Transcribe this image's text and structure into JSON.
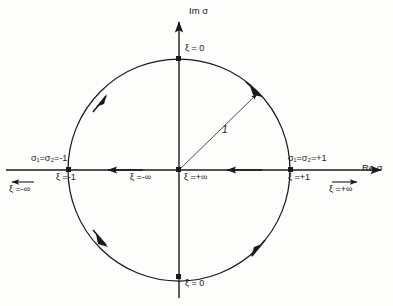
{
  "figure": {
    "kind": "complex-plane-unit-circle-contour",
    "background_color": "#fdfdfc",
    "line_color": "#1a1a1a",
    "axes": {
      "real_axis_label": "Re σ",
      "imag_axis_label": "Im σ"
    },
    "circle": {
      "center_x": 179,
      "center_y": 170,
      "radius": 111,
      "radius_label": "1"
    },
    "labels": {
      "top_xi": "ξ = 0",
      "bottom_xi": "ξ = 0",
      "left_sigma": "σ₁=σ₂=-1",
      "left_xi_unit": "ξ =-1",
      "left_xi_inf": "ξ =-∞",
      "right_sigma": "σ₁=σ₂=+1",
      "right_xi_unit": "ξ =+1",
      "right_xi_inf": "ξ =+∞",
      "origin_left_xi": "ξ =-∞",
      "origin_right_xi": "ξ =+∞"
    },
    "markers": [
      {
        "name": "point-top",
        "position": "0,+1"
      },
      {
        "name": "point-bottom",
        "position": "0,-1"
      },
      {
        "name": "point-left",
        "position": "-1,0"
      },
      {
        "name": "point-right",
        "position": "+1,0"
      },
      {
        "name": "point-origin",
        "position": "0,0"
      }
    ],
    "arrows": [
      {
        "name": "circle-arrow-upper-left",
        "direction": "counterclockwise-up"
      },
      {
        "name": "circle-arrow-lower-left",
        "direction": "counterclockwise-down"
      },
      {
        "name": "circle-arrow-upper-right",
        "direction": "clockwise-down"
      },
      {
        "name": "circle-arrow-lower-right",
        "direction": "clockwise-up"
      },
      {
        "name": "axis-arrow-left-inner",
        "direction": "left"
      },
      {
        "name": "axis-arrow-right-inner",
        "direction": "left"
      },
      {
        "name": "axis-arrow-far-left",
        "direction": "left"
      },
      {
        "name": "axis-arrow-far-right",
        "direction": "right"
      },
      {
        "name": "imag-axis-arrow",
        "direction": "up"
      },
      {
        "name": "radius-arrow",
        "direction": "outward-45deg"
      }
    ]
  }
}
